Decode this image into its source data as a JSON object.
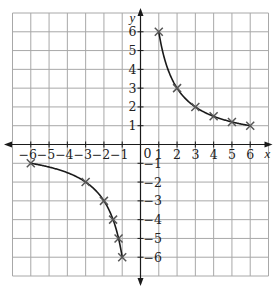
{
  "chart_data": {
    "type": "line",
    "title": "",
    "xlabel": "x",
    "ylabel": "y",
    "xlim": [
      -7,
      7
    ],
    "ylim": [
      -7,
      7
    ],
    "grid": true,
    "x_ticks": [
      -6,
      -5,
      -4,
      -3,
      -2,
      -1,
      1,
      2,
      3,
      4,
      5,
      6
    ],
    "y_ticks": [
      -6,
      -5,
      -4,
      -3,
      -2,
      -1,
      1,
      2,
      3,
      4,
      5,
      6
    ],
    "origin_label": "0",
    "x_tick_labels": [
      "−6",
      "−5",
      "−4",
      "−3",
      "−2",
      "−1",
      "1",
      "2",
      "3",
      "4",
      "5",
      "6"
    ],
    "y_tick_labels": [
      "−6",
      "−5",
      "−4",
      "−3",
      "−2",
      "−1",
      "1",
      "2",
      "3",
      "4",
      "5",
      "6"
    ],
    "series": [
      {
        "name": "y = 6/x (x > 0)",
        "marker": "x",
        "x": [
          1,
          2,
          3,
          4,
          5,
          6
        ],
        "y": [
          6,
          3,
          2,
          1.5,
          1.2,
          1
        ]
      },
      {
        "name": "y = 6/x (x < 0)",
        "marker": "x",
        "x": [
          -6,
          -3,
          -2,
          -1.5,
          -1.2,
          -1
        ],
        "y": [
          -1,
          -2,
          -3,
          -4,
          -5,
          -6
        ]
      }
    ],
    "colors": {
      "grid": "#a8a8a8",
      "axes": "#1a1a1a",
      "curve": "#1a1a1a",
      "marker": "#555555"
    }
  }
}
